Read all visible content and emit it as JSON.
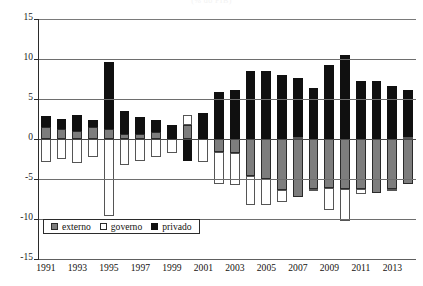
{
  "chart_data": {
    "type": "bar",
    "title": "(% do PIB)",
    "subtitle": "",
    "xlabel": "",
    "ylabel": "",
    "stacked": true,
    "grid": true,
    "legend_position": "inside-bottom-left",
    "ylim": [
      -15,
      15
    ],
    "yticks": [
      15,
      10,
      5,
      0,
      -5,
      -10,
      -15
    ],
    "ytick_labels": [
      "15",
      "10",
      "5",
      "0",
      "-5",
      "-10",
      "-15"
    ],
    "categories": [
      "1991",
      "1992",
      "1993",
      "1994",
      "1995",
      "1996",
      "1997",
      "1998",
      "1999",
      "2000",
      "2001",
      "2002",
      "2003",
      "2004",
      "2005",
      "2006",
      "2007",
      "2008",
      "2009",
      "2010",
      "2011",
      "2012",
      "2013",
      "2014"
    ],
    "xtick_labels": [
      "1991",
      "1993",
      "1995",
      "1997",
      "1999",
      "2001",
      "2003",
      "2005",
      "2007",
      "2009",
      "2011",
      "2013"
    ],
    "series": [
      {
        "name": "externo",
        "color": "#7d7d7d",
        "values": [
          1.5,
          1.3,
          1.0,
          1.5,
          1.2,
          0.6,
          0.6,
          0.9,
          0.0,
          1.8,
          0.0,
          -1.6,
          -1.8,
          -4.6,
          -5.0,
          -6.4,
          -7.3,
          -6.2,
          -6.1,
          -6.2,
          -6.3,
          -6.8,
          -6.2,
          -5.6
        ]
      },
      {
        "name": "governo",
        "color": "#ffffff",
        "values": [
          -2.9,
          -2.5,
          -3.0,
          -2.3,
          -9.6,
          -3.3,
          -2.7,
          -2.2,
          -1.7,
          1.2,
          -2.9,
          -4.0,
          -4.0,
          -3.7,
          -3.2,
          -1.5,
          0.2,
          -0.1,
          -2.8,
          -4.0,
          -0.6,
          0.0,
          -0.2,
          0.2
        ]
      },
      {
        "name": "privado",
        "color": "#101010",
        "values": [
          1.4,
          1.2,
          2.0,
          0.9,
          8.4,
          2.9,
          2.2,
          1.5,
          1.7,
          -2.8,
          3.2,
          5.9,
          6.1,
          8.5,
          8.5,
          8.0,
          7.4,
          6.4,
          9.2,
          10.5,
          7.2,
          7.2,
          6.6,
          5.9
        ]
      }
    ]
  },
  "legend": {
    "items": [
      {
        "label": "externo",
        "swatch": "externo"
      },
      {
        "label": "governo",
        "swatch": "governo"
      },
      {
        "label": "privado",
        "swatch": "privado"
      }
    ]
  },
  "colors": {
    "externo": "#7d7d7d",
    "governo": "#ffffff",
    "privado": "#101010",
    "axis": "#2b2b2b",
    "grid": "#6e6e6e",
    "text": "#15130f",
    "background": "#ffffff"
  }
}
